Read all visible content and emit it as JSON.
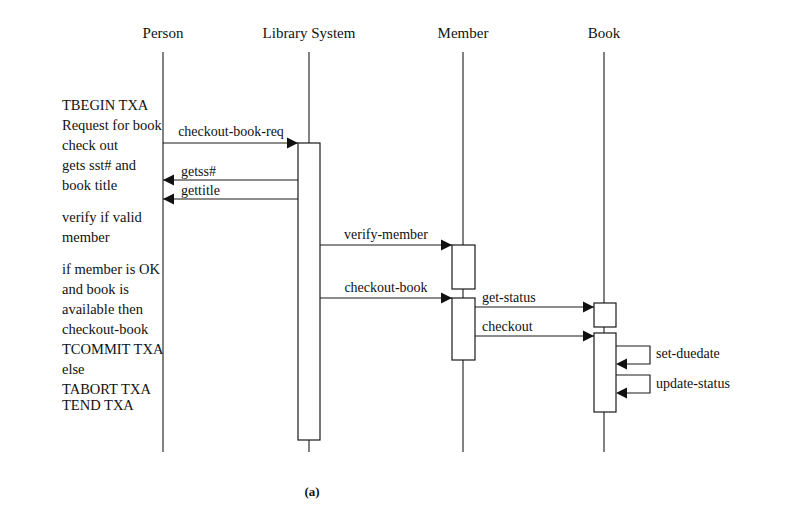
{
  "figure": {
    "caption": "(a)",
    "caption_x": 312,
    "caption_y": 496,
    "type": "uml-sequence-diagram"
  },
  "lifelines": [
    {
      "id": "person",
      "label": "Person",
      "x": 163,
      "label_y": 38,
      "top": 52,
      "bottom": 452
    },
    {
      "id": "library",
      "label": "Library System",
      "x": 309,
      "label_y": 38,
      "top": 52,
      "bottom": 452
    },
    {
      "id": "member",
      "label": "Member",
      "x": 463,
      "label_y": 38,
      "top": 52,
      "bottom": 452
    },
    {
      "id": "book",
      "label": "Book",
      "x": 604,
      "label_y": 38,
      "top": 52,
      "bottom": 452
    }
  ],
  "activations": [
    {
      "id": "library-activation",
      "lifeline": "library",
      "x": 298,
      "y": 143,
      "width": 22,
      "height": 297
    },
    {
      "id": "member-activation-verify",
      "lifeline": "member",
      "x": 452,
      "y": 245,
      "width": 23,
      "height": 44
    },
    {
      "id": "member-activation-checkout",
      "lifeline": "member",
      "x": 452,
      "y": 298,
      "width": 23,
      "height": 62
    },
    {
      "id": "book-activation-getstatus",
      "lifeline": "book",
      "x": 594,
      "y": 303,
      "width": 22,
      "height": 24
    },
    {
      "id": "book-activation-checkout",
      "lifeline": "book",
      "x": 594,
      "y": 333,
      "width": 22,
      "height": 79
    }
  ],
  "messages": [
    {
      "id": "checkout-book-req",
      "label": "checkout-book-req",
      "from": "person",
      "to": "library",
      "x1": 163,
      "x2": 298,
      "y": 143,
      "direction": "right",
      "label_x": 231,
      "label_y": 136,
      "label_align": "center"
    },
    {
      "id": "getss",
      "label": "getss#",
      "from": "library",
      "to": "person",
      "x1": 298,
      "x2": 163,
      "y": 180,
      "direction": "left",
      "label_x": 181,
      "label_y": 176,
      "label_align": "start"
    },
    {
      "id": "gettitle",
      "label": "gettitle",
      "from": "library",
      "to": "person",
      "x1": 298,
      "x2": 163,
      "y": 199,
      "direction": "left",
      "label_x": 181,
      "label_y": 195,
      "label_align": "start"
    },
    {
      "id": "verify-member",
      "label": "verify-member",
      "from": "library",
      "to": "member",
      "x1": 320,
      "x2": 452,
      "y": 245,
      "direction": "right",
      "label_x": 386,
      "label_y": 239,
      "label_align": "center"
    },
    {
      "id": "checkout-book",
      "label": "checkout-book",
      "from": "library",
      "to": "member",
      "x1": 320,
      "x2": 452,
      "y": 298,
      "direction": "right",
      "label_x": 386,
      "label_y": 292,
      "label_align": "center"
    },
    {
      "id": "get-status",
      "label": "get-status",
      "from": "member",
      "to": "book",
      "x1": 475,
      "x2": 594,
      "y": 307,
      "direction": "right",
      "label_x": 482,
      "label_y": 302,
      "label_align": "start"
    },
    {
      "id": "checkout",
      "label": "checkout",
      "from": "member",
      "to": "book",
      "x1": 475,
      "x2": 594,
      "y": 336,
      "direction": "right",
      "label_x": 482,
      "label_y": 331,
      "label_align": "start"
    }
  ],
  "self_messages": [
    {
      "id": "set-duedate",
      "label": "set-duedate",
      "lifeline": "book",
      "x_box": 616,
      "x_out": 650,
      "y_top": 346,
      "y_bottom": 364,
      "label_x": 656,
      "label_y": 358
    },
    {
      "id": "update-status",
      "label": "update-status",
      "lifeline": "book",
      "x_box": 616,
      "x_out": 650,
      "y_top": 375,
      "y_bottom": 393,
      "label_x": 656,
      "label_y": 388
    }
  ],
  "notes": {
    "x": 62,
    "lines": [
      {
        "text": "TBEGIN TXA",
        "y": 110
      },
      {
        "text": "Request for book",
        "y": 130
      },
      {
        "text": "check out",
        "y": 150
      },
      {
        "text": "gets sst# and",
        "y": 170
      },
      {
        "text": "book title",
        "y": 190
      },
      {
        "text": "verify if valid",
        "y": 222
      },
      {
        "text": "member",
        "y": 242
      },
      {
        "text": "if member is OK",
        "y": 274
      },
      {
        "text": "and book is",
        "y": 294
      },
      {
        "text": "available then",
        "y": 314
      },
      {
        "text": "checkout-book",
        "y": 334
      },
      {
        "text": "TCOMMIT TXA",
        "y": 354
      },
      {
        "text": "else",
        "y": 374
      },
      {
        "text": "TABORT TXA",
        "y": 394
      },
      {
        "text": " TEND TXA",
        "y": 410
      }
    ]
  },
  "colors": {
    "ink": "#141414",
    "background": "#ffffff"
  }
}
